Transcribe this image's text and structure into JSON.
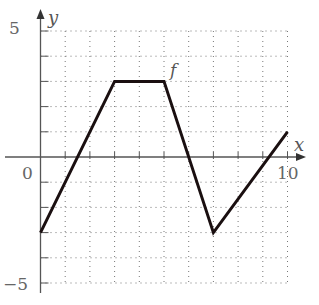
{
  "chart_data": {
    "type": "line",
    "title": "",
    "xlabel": "x",
    "ylabel": "y",
    "function_label": "f",
    "xlim": [
      0,
      10
    ],
    "ylim": [
      -5,
      5
    ],
    "x_tick_labels": [
      "0",
      "10"
    ],
    "y_tick_labels": [
      "5",
      "-5"
    ],
    "grid": true,
    "grid_style": "dotted",
    "series": [
      {
        "name": "f",
        "x": [
          0,
          3,
          5,
          7,
          10
        ],
        "y": [
          -3,
          3,
          3,
          -3,
          1
        ]
      }
    ]
  },
  "labels": {
    "x_axis": "x",
    "y_axis": "y",
    "func": "f",
    "origin": "0",
    "x_max": "10",
    "y_max": "5",
    "y_min": "−5"
  }
}
